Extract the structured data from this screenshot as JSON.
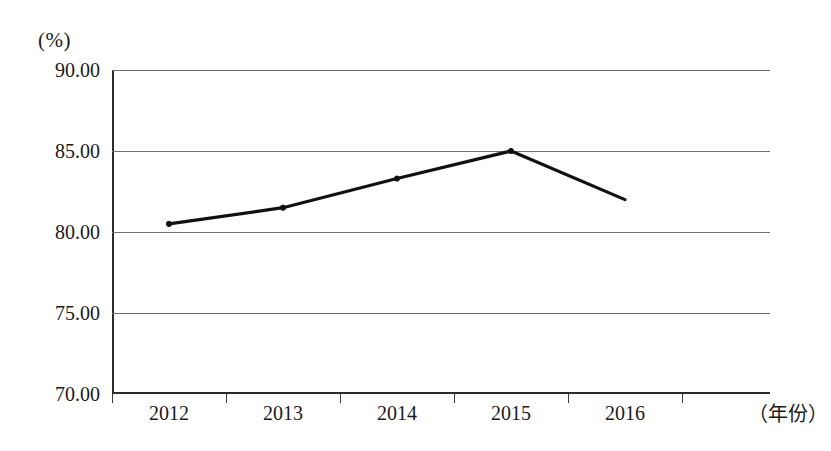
{
  "chart_data": {
    "type": "line",
    "title": "",
    "xlabel": "（年份）",
    "ylabel": "(%)",
    "categories": [
      "2012",
      "2013",
      "2014",
      "2015",
      "2016"
    ],
    "values": [
      80.5,
      81.5,
      83.3,
      85.0,
      82.0
    ],
    "series": [
      {
        "name": "",
        "values": [
          80.5,
          81.5,
          83.3,
          85.0,
          82.0
        ]
      }
    ],
    "y_ticks": [
      "70.00",
      "75.00",
      "80.00",
      "85.00",
      "90.00"
    ],
    "y_tick_values": [
      70,
      75,
      80,
      85,
      90
    ],
    "ylim": [
      70,
      90
    ],
    "grid": true,
    "legend": "none",
    "line_color": "#111111",
    "grid_color": "#6f6f6f",
    "axis_color": "#2b2b2b"
  },
  "axes": {
    "unit_caption": "(%)",
    "x_axis_caption": "（年份）"
  }
}
